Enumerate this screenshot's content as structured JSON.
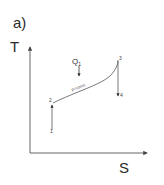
{
  "figure": {
    "panel_label": "a)",
    "y_axis_label": "T",
    "x_axis_label": "S",
    "heat_label_main": "Q",
    "heat_label_sub": "1",
    "curve_label": "p=const.",
    "points": [
      {
        "id": "1",
        "label": "1",
        "x": 52,
        "y": 128
      },
      {
        "id": "2",
        "label": "2",
        "x": 53,
        "y": 103
      },
      {
        "id": "3",
        "label": "3",
        "x": 118,
        "y": 60
      },
      {
        "id": "4",
        "label": "4",
        "x": 118,
        "y": 95
      }
    ],
    "processes": [
      {
        "from": "1",
        "to": "2",
        "type": "compression",
        "direction": "up"
      },
      {
        "from": "2",
        "to": "3",
        "type": "heat addition at constant pressure"
      },
      {
        "from": "3",
        "to": "4",
        "type": "expansion",
        "direction": "down"
      }
    ],
    "colors": {
      "line": "#555555",
      "text": "#2a2a2a",
      "background": "#ffffff"
    }
  }
}
